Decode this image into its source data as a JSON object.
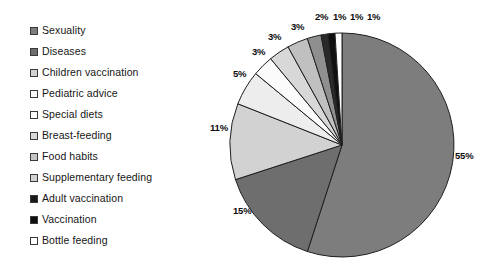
{
  "chart_data": {
    "type": "pie",
    "title": "",
    "xlabel": "",
    "ylabel": "",
    "legend_position": "left",
    "grid": false,
    "categories": [
      "Sexuality",
      "Diseases",
      "Children vaccination",
      "Pediatric advice",
      "Special diets",
      "Breast-feeding",
      "Food habits",
      "Supplementary feeding",
      "Adult vaccination",
      "Vaccination",
      "Bottle feeding"
    ],
    "values": [
      55,
      15,
      11,
      5,
      3,
      3,
      3,
      2,
      1,
      1,
      1
    ],
    "value_labels": [
      "55%",
      "15%",
      "11%",
      "5%",
      "3%",
      "3%",
      "3%",
      "2%",
      "1%",
      "1%",
      "1%"
    ],
    "unit": "%",
    "slice_colors": [
      "#7d7d7d",
      "#6e6e6e",
      "#d2d2d2",
      "#ededed",
      "#fbfbfb",
      "#d8d8d8",
      "#c0c0c0",
      "#8f8f8f",
      "#2a2a2a",
      "#101010",
      "#ffffff"
    ],
    "start_angle_deg": 0,
    "direction": "clockwise"
  },
  "legend": {
    "items": [
      {
        "label": "Sexuality",
        "color": "#7d7d7d"
      },
      {
        "label": "Diseases",
        "color": "#6e6e6e"
      },
      {
        "label": "Children vaccination",
        "color": "#d2d2d2"
      },
      {
        "label": "Pediatric advice",
        "color": "#fbfbfb"
      },
      {
        "label": "Special diets",
        "color": "#fdfdfd"
      },
      {
        "label": "Breast-feeding",
        "color": "#d8d8d8"
      },
      {
        "label": "Food habits",
        "color": "#c6c6c6"
      },
      {
        "label": "Supplementary feeding",
        "color": "#d2d2d2"
      },
      {
        "label": "Adult vaccination",
        "color": "#1a1a1a"
      },
      {
        "label": "Vaccination",
        "color": "#101010"
      },
      {
        "label": "Bottle feeding",
        "color": "#ffffff"
      }
    ]
  },
  "pie_labels": [
    {
      "text": "55%",
      "left": 455,
      "top": 150
    },
    {
      "text": "15%",
      "left": 233,
      "top": 205
    },
    {
      "text": "11%",
      "left": 210,
      "top": 122
    },
    {
      "text": "5%",
      "left": 233,
      "top": 68
    },
    {
      "text": "3%",
      "left": 252,
      "top": 46
    },
    {
      "text": "3%",
      "left": 268,
      "top": 31
    },
    {
      "text": "3%",
      "left": 291,
      "top": 21
    },
    {
      "text": "2%",
      "left": 315,
      "top": 11
    },
    {
      "text": "1%",
      "left": 333,
      "top": 11
    },
    {
      "text": "1%",
      "left": 350,
      "top": 11
    },
    {
      "text": "1%",
      "left": 367,
      "top": 11
    }
  ]
}
